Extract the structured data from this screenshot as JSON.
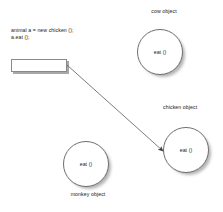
{
  "diagram": {
    "background_color": "#ffffff",
    "stroke_color": "#6e6e6e",
    "text_color": "#1a1a1a",
    "shadow_color": "#a8a8a8"
  },
  "code": {
    "line1": "animal a = new chicken ();",
    "line2": "a.eat ();"
  },
  "variable_box": {
    "label": "",
    "name": "reference variable a"
  },
  "objects": [
    {
      "id": "cow",
      "caption": "cow object",
      "method": "eat ()"
    },
    {
      "id": "chicken",
      "caption": "chicken object",
      "method": "eat ()"
    },
    {
      "id": "monkey",
      "caption": "monkey object",
      "method": "eat ()"
    }
  ],
  "arrow": {
    "from": "variable box",
    "to": "chicken object",
    "color": "#555555"
  }
}
